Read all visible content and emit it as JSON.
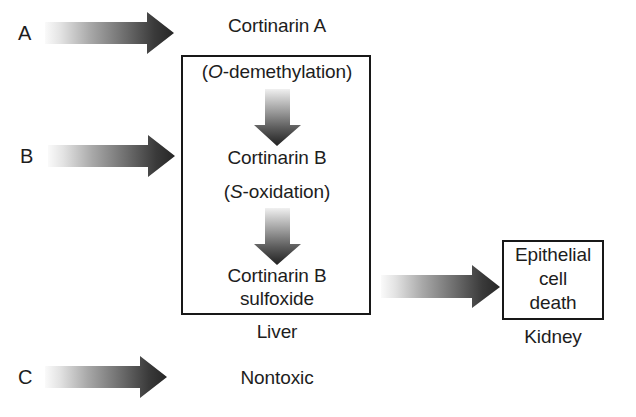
{
  "diagram": {
    "colors": {
      "line": "#181818",
      "text": "#1d1d1d",
      "arrow_light": "#f2f2f2",
      "arrow_dark": "#2b2b2b",
      "background": "#ffffff"
    },
    "row_labels": [
      {
        "id": "a",
        "label": "A"
      },
      {
        "id": "b",
        "label": "B"
      },
      {
        "id": "c",
        "label": "C"
      }
    ],
    "nodes": {
      "cortinarin_a": "Cortinarin A",
      "o_demethylation_open": "(",
      "o_demethylation_italic": "O",
      "o_demethylation_rest": "-demethylation)",
      "cortinarin_b": "Cortinarin B",
      "s_oxidation_open": "(",
      "s_oxidation_italic": "S",
      "s_oxidation_rest": "-oxidation)",
      "cortinarin_b_sulfoxide_line1": "Cortinarin B",
      "cortinarin_b_sulfoxide_line2": "sulfoxide",
      "nontoxic": "Nontoxic",
      "epithelial_line1": "Epithelial",
      "epithelial_line2": "cell",
      "epithelial_line3": "death"
    },
    "organ_labels": {
      "liver": "Liver",
      "kidney": "Kidney"
    },
    "arrows": {
      "a_to_liver": "arrow-right-gradient",
      "b_to_liver": "arrow-right-gradient",
      "c_to_nontoxic": "arrow-right-gradient",
      "demethylation_step": "arrow-down-gradient",
      "oxidation_step": "arrow-down-gradient",
      "liver_to_kidney": "arrow-right-gradient"
    }
  }
}
